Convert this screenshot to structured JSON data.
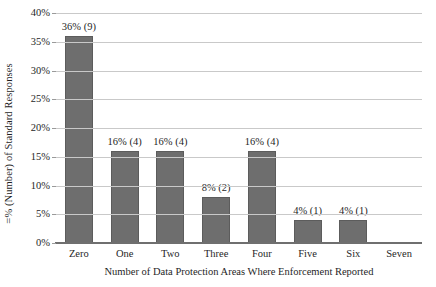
{
  "chart_data": {
    "type": "bar",
    "title": "",
    "subtitle": "",
    "xlabel": "Number of Data Protection Areas Where Enforcement Reported",
    "ylabel": "=% (Number) of Standard Responses",
    "categories": [
      "Zero",
      "One",
      "Two",
      "Three",
      "Four",
      "Five",
      "Six",
      "Seven"
    ],
    "values": [
      36,
      16,
      16,
      8,
      16,
      4,
      4,
      0
    ],
    "counts": [
      9,
      4,
      4,
      2,
      4,
      1,
      1,
      0
    ],
    "data_labels": [
      "36% (9)",
      "16% (4)",
      "16% (4)",
      "8% (2)",
      "16% (4)",
      "4% (1)",
      "4% (1)",
      ""
    ],
    "ylim": [
      0,
      40
    ],
    "ytick_values": [
      0,
      5,
      10,
      15,
      20,
      25,
      30,
      35,
      40
    ],
    "ytick_labels": [
      "0%",
      "5%",
      "10%",
      "15%",
      "20%",
      "25%",
      "30%",
      "35%",
      "40%"
    ],
    "grid": true,
    "legend": "none",
    "bar_color": "#6e6e6e",
    "gridline_color": "#c9c9c9",
    "axis_color": "#6f6f6f",
    "background_color": "#ffffff"
  }
}
